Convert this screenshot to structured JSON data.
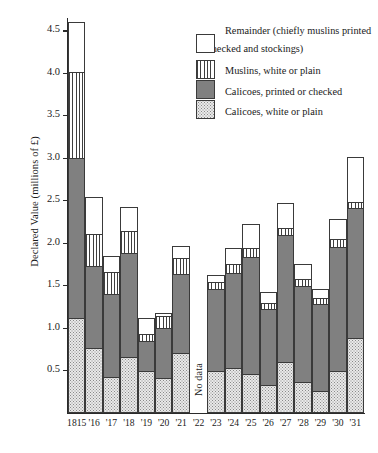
{
  "chart_data": {
    "type": "bar",
    "title": "",
    "subtype": "stacked-bar",
    "xlabel": "",
    "ylabel": "Declared Value (millions of £)",
    "ylim": [
      0,
      4.75
    ],
    "yticks": [
      0.5,
      1.0,
      1.5,
      2.0,
      2.5,
      3.0,
      3.5,
      4.0,
      4.5
    ],
    "ytick_labels": [
      "0.5",
      "1.0",
      "1.5",
      "2.0",
      "2.5",
      "3.0",
      "3.5",
      "4.0",
      "4.5"
    ],
    "grid": false,
    "legend_position": "upper-right",
    "categories": [
      "1815",
      "'16",
      "'17",
      "'18",
      "'19",
      "'20",
      "'21",
      "'22",
      "'23",
      "'24",
      "'25",
      "'26",
      "'27",
      "'28",
      "'29",
      "'30",
      "'31"
    ],
    "series": [
      {
        "name": "Calicoes, white or plain",
        "key": "calwhite",
        "pattern": "stippled",
        "color": "#e9e9e9",
        "values": [
          1.12,
          0.77,
          0.43,
          0.66,
          0.5,
          0.41,
          0.71,
          null,
          0.5,
          0.53,
          0.46,
          0.33,
          0.6,
          0.37,
          0.26,
          0.5,
          0.88
        ]
      },
      {
        "name": "Calicoes, printed or checked",
        "key": "calprint",
        "pattern": "solid-grey",
        "color": "#808080",
        "values": [
          1.88,
          0.96,
          0.97,
          1.22,
          0.35,
          0.59,
          0.93,
          null,
          0.96,
          1.12,
          1.38,
          0.9,
          1.5,
          1.13,
          1.02,
          1.46,
          1.54
        ]
      },
      {
        "name": "Muslins, white or plain",
        "key": "muslin",
        "pattern": "vertical-stripes",
        "color": "#ffffff",
        "values": [
          1.02,
          0.38,
          0.26,
          0.26,
          0.08,
          0.14,
          0.18,
          null,
          0.08,
          0.1,
          0.1,
          0.06,
          0.08,
          0.08,
          0.08,
          0.09,
          0.06
        ]
      },
      {
        "name": "Remainder (chiefly muslins printed or checked and stockings)",
        "key": "remainder",
        "pattern": "white",
        "color": "#ffffff",
        "values": [
          0.58,
          0.43,
          0.19,
          0.29,
          0.19,
          0.04,
          0.15,
          null,
          0.08,
          0.19,
          0.29,
          0.14,
          0.29,
          0.17,
          0.1,
          0.23,
          0.53
        ]
      }
    ],
    "totals": [
      4.6,
      2.54,
      1.85,
      2.43,
      1.12,
      1.18,
      1.97,
      null,
      1.62,
      1.94,
      2.23,
      1.43,
      2.47,
      1.75,
      1.46,
      2.28,
      3.01
    ],
    "annotations": [
      {
        "text": "No data",
        "category": "'22",
        "orientation": "vertical"
      }
    ]
  },
  "legend": {
    "items": [
      {
        "label": "Remainder (chiefly muslins printed or checked and stockings)",
        "key": "remainder"
      },
      {
        "label": "Muslins, white or plain",
        "key": "muslin"
      },
      {
        "label": "Calicoes, printed or checked",
        "key": "calprint"
      },
      {
        "label": "Calicoes, white or plain",
        "key": "calwhite"
      }
    ]
  },
  "axis": {
    "y_title": "Declared Value (millions of £)"
  }
}
